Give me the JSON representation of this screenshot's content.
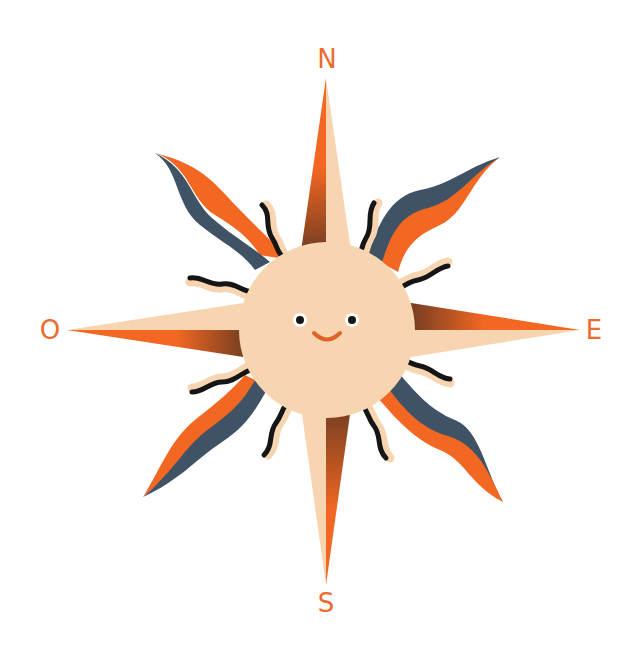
{
  "illustration": {
    "subject": "compass-rose-sun",
    "labels": {
      "north": "N",
      "east": "E",
      "south": "S",
      "west": "O"
    },
    "colors": {
      "background": "#ffffff",
      "sun": "#f6d5b0",
      "orange": "#f26722",
      "navy": "#3f5266",
      "brown": "#6b3a22",
      "black": "#151515",
      "label": "#ec6b2d"
    },
    "face": {
      "expression": "smile"
    }
  }
}
